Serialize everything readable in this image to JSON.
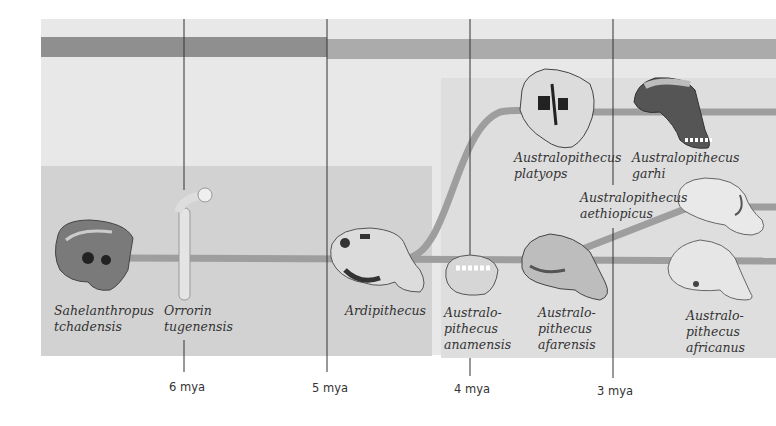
{
  "diagram": {
    "title": "",
    "timeline": {
      "ticks": [
        {
          "label": "6 mya",
          "value": 6
        },
        {
          "label": "5 mya",
          "value": 5
        },
        {
          "label": "4 mya",
          "value": 4
        },
        {
          "label": "3 mya",
          "value": 3
        }
      ]
    },
    "species": [
      {
        "id": "sahelanthropus",
        "lines": [
          "Sahelanthropus",
          "tchadensis"
        ],
        "fossil": "skull-icon"
      },
      {
        "id": "orrorin",
        "lines": [
          "Orrorin",
          "tugenensis"
        ],
        "fossil": "femur-icon"
      },
      {
        "id": "ardipithecus",
        "lines": [
          "Ardipithecus"
        ],
        "fossil": "skull-icon"
      },
      {
        "id": "anamensis",
        "lines": [
          "Australo-",
          "pithecus",
          "anamensis"
        ],
        "fossil": "jaw-icon"
      },
      {
        "id": "afarensis",
        "lines": [
          "Australo-",
          "pithecus",
          "afarensis"
        ],
        "fossil": "skull-icon"
      },
      {
        "id": "platyops",
        "lines": [
          "Australopithecus",
          "platyops"
        ],
        "fossil": "skull-icon"
      },
      {
        "id": "garhi",
        "lines": [
          "Australopithecus",
          "garhi"
        ],
        "fossil": "skull-icon"
      },
      {
        "id": "aethiopicus",
        "lines": [
          "Australopithecus",
          "aethiopicus"
        ],
        "fossil": "skull-icon"
      },
      {
        "id": "africanus",
        "lines": [
          "Australo-",
          "pithecus",
          "africanus"
        ],
        "fossil": "skull-icon"
      }
    ],
    "colors": {
      "background_light": "#e8e8e8",
      "background_mid": "#d4d4d4",
      "band_dark": "#8f8f8f",
      "band_light": "#a9a9a9",
      "lineage": "#9a9a9a",
      "axis_line": "#333333"
    }
  }
}
